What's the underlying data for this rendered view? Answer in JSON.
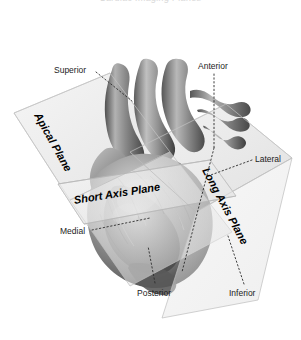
{
  "figure": {
    "title_remnant": "Cardiac Imaging Planes",
    "background_color": "#ffffff",
    "plane_fill_color": "#ececec",
    "plane_edge_color": "#b9b9b9",
    "leader_line_color": "#2b2b2b",
    "heart_tone_dark": "#4a4a4a",
    "heart_tone_mid": "#8d8d8d",
    "heart_tone_light": "#cfcfcf"
  },
  "planes": [
    {
      "id": "apical",
      "label": "Apical Plane"
    },
    {
      "id": "short-axis",
      "label": "Short Axis Plane"
    },
    {
      "id": "long-axis",
      "label": "Long Axis Plane"
    }
  ],
  "orientation_labels": [
    {
      "id": "superior",
      "label": "Superior"
    },
    {
      "id": "anterior",
      "label": "Anterior"
    },
    {
      "id": "lateral",
      "label": "Lateral"
    },
    {
      "id": "medial",
      "label": "Medial"
    },
    {
      "id": "posterior",
      "label": "Posterior"
    },
    {
      "id": "inferior",
      "label": "Inferior"
    }
  ],
  "subject": {
    "name": "heart",
    "description": "Grayscale anatomical heart with great vessels"
  }
}
